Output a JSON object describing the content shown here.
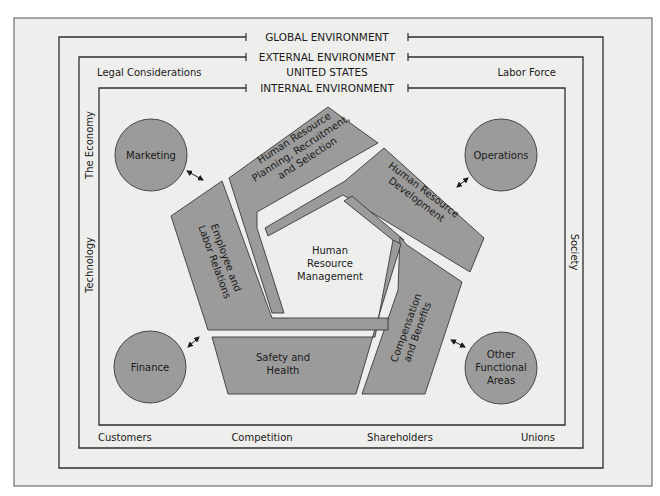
{
  "environments": {
    "global": "GLOBAL ENVIRONMENT",
    "external": "EXTERNAL ENVIRONMENT",
    "external_sub": "UNITED STATES",
    "internal": "INTERNAL ENVIRONMENT"
  },
  "external_factors": {
    "top_left": "Legal Considerations",
    "top_right": "Labor Force",
    "left_upper": "The Economy",
    "left_lower": "Technology",
    "right": "Society",
    "bottom": [
      "Customers",
      "Competition",
      "Shareholders",
      "Unions"
    ]
  },
  "center": {
    "line1": "Human",
    "line2": "Resource",
    "line3": "Management"
  },
  "hr_functions": [
    {
      "id": "planning",
      "lines": [
        "Human Resource",
        "Planning, Recruitment,",
        "and Selection"
      ]
    },
    {
      "id": "development",
      "lines": [
        "Human Resource",
        "Development"
      ]
    },
    {
      "id": "compensation",
      "lines": [
        "Compensation",
        "and Benefits"
      ]
    },
    {
      "id": "safety",
      "lines": [
        "Safety and",
        "Health"
      ]
    },
    {
      "id": "employee",
      "lines": [
        "Employee and",
        "Labor Relations"
      ]
    }
  ],
  "functional_areas": [
    {
      "id": "marketing",
      "lines": [
        "Marketing"
      ]
    },
    {
      "id": "operations",
      "lines": [
        "Operations"
      ]
    },
    {
      "id": "finance",
      "lines": [
        "Finance"
      ]
    },
    {
      "id": "other",
      "lines": [
        "Other",
        "Functional",
        "Areas"
      ]
    }
  ],
  "colors": {
    "background": "#eeeeec",
    "shape_fill": "#9b9b9b",
    "line": "#2e2e2e"
  }
}
